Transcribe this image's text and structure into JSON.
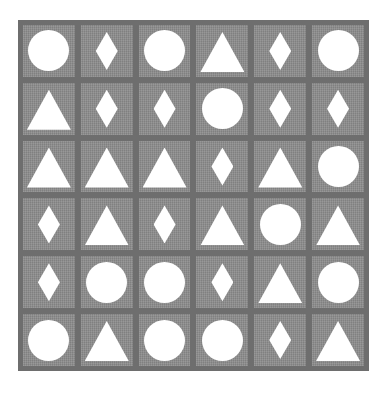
{
  "board": {
    "rows": 6,
    "cols": 6,
    "colors": {
      "frame": "#6e6e6e",
      "cell": "#8c8c8c",
      "shape": "#ffffff"
    },
    "grid": [
      [
        "circle",
        "diamond",
        "circle",
        "triangle",
        "diamond",
        "circle"
      ],
      [
        "triangle",
        "diamond",
        "diamond",
        "circle",
        "diamond",
        "diamond"
      ],
      [
        "triangle",
        "triangle",
        "triangle",
        "diamond",
        "triangle",
        "circle"
      ],
      [
        "diamond",
        "triangle",
        "diamond",
        "triangle",
        "circle",
        "triangle"
      ],
      [
        "diamond",
        "circle",
        "circle",
        "diamond",
        "triangle",
        "circle"
      ],
      [
        "circle",
        "triangle",
        "circle",
        "circle",
        "diamond",
        "triangle"
      ]
    ]
  }
}
